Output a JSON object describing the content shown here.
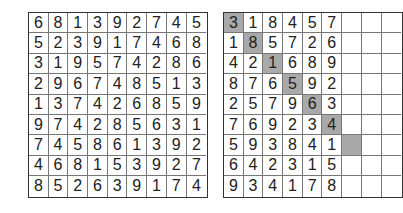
{
  "puzzles": [
    {
      "name": "solution-grid-left",
      "rows": [
        [
          6,
          8,
          1,
          3,
          9,
          2,
          7,
          4,
          5
        ],
        [
          5,
          2,
          3,
          9,
          1,
          7,
          4,
          6,
          8
        ],
        [
          3,
          1,
          9,
          5,
          7,
          4,
          2,
          8,
          6
        ],
        [
          2,
          9,
          6,
          7,
          4,
          8,
          5,
          1,
          3
        ],
        [
          1,
          3,
          7,
          4,
          2,
          6,
          8,
          5,
          9
        ],
        [
          9,
          7,
          4,
          2,
          8,
          5,
          6,
          3,
          1
        ],
        [
          7,
          4,
          5,
          8,
          6,
          1,
          3,
          9,
          2
        ],
        [
          4,
          6,
          8,
          1,
          5,
          3,
          9,
          2,
          7
        ],
        [
          8,
          5,
          2,
          6,
          3,
          9,
          1,
          7,
          4
        ]
      ],
      "shaded": []
    },
    {
      "name": "solution-grid-right",
      "rows": [
        [
          3,
          1,
          8,
          4,
          5,
          7,
          "",
          "",
          ""
        ],
        [
          1,
          8,
          5,
          7,
          2,
          6,
          "",
          "",
          ""
        ],
        [
          4,
          2,
          1,
          6,
          8,
          9,
          "",
          "",
          ""
        ],
        [
          8,
          7,
          6,
          5,
          9,
          2,
          "",
          "",
          ""
        ],
        [
          2,
          5,
          7,
          9,
          6,
          3,
          "",
          "",
          ""
        ],
        [
          7,
          6,
          9,
          2,
          3,
          4,
          "",
          "",
          ""
        ],
        [
          5,
          9,
          3,
          8,
          4,
          1,
          "",
          "",
          ""
        ],
        [
          6,
          4,
          2,
          3,
          1,
          5,
          "",
          "",
          ""
        ],
        [
          9,
          3,
          4,
          1,
          7,
          8,
          "",
          "",
          ""
        ]
      ],
      "shaded": [
        [
          0,
          0
        ],
        [
          1,
          1
        ],
        [
          2,
          2
        ],
        [
          3,
          3
        ],
        [
          4,
          4
        ],
        [
          5,
          5
        ],
        [
          6,
          6
        ]
      ]
    }
  ],
  "colors": {
    "shade": "#a9a9a9",
    "border": "#333333",
    "text": "#222222"
  }
}
